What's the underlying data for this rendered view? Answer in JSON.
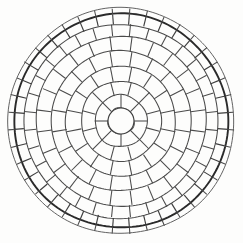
{
  "figure": {
    "type": "concentric-radial-segment-diagram",
    "background_color": "#fdfdfc",
    "line_color": "#4a4a4a",
    "accent_line_color": "#2a2a2a",
    "center": {
      "x": 121,
      "y": 121
    },
    "canvas": {
      "width": 243,
      "height": 243
    }
  },
  "chart_data": {
    "type": "pie",
    "xlabel": "",
    "ylabel": "",
    "categories": [
      "hub",
      "ring-1",
      "ring-2",
      "ring-3",
      "ring-4",
      "ring-5",
      "ring-6",
      "ring-7",
      "rim-band"
    ],
    "values": [
      1,
      8,
      12,
      16,
      20,
      24,
      32,
      40,
      40
    ],
    "series": [
      {
        "name": "segment_count",
        "values": [
          1,
          8,
          12,
          16,
          20,
          24,
          32,
          40,
          40
        ]
      },
      {
        "name": "inner_radius",
        "values": [
          0,
          13,
          26,
          40,
          55,
          70,
          85,
          97,
          107
        ]
      },
      {
        "name": "outer_radius",
        "values": [
          13,
          26,
          40,
          55,
          70,
          85,
          97,
          107,
          113
        ]
      },
      {
        "name": "start_angle_deg",
        "values": [
          0,
          0,
          15,
          11.25,
          9,
          7.5,
          5.625,
          4.5,
          4.5
        ]
      }
    ],
    "grid": false,
    "legend": "none"
  },
  "rings": [
    {
      "name": "hub",
      "r_in": 0,
      "r_out": 13,
      "segments": 1,
      "offset": 0,
      "thick": false
    },
    {
      "name": "ring-1",
      "r_in": 13,
      "r_out": 26,
      "segments": 8,
      "offset": 0,
      "thick": false
    },
    {
      "name": "ring-2",
      "r_in": 26,
      "r_out": 40,
      "segments": 12,
      "offset": 15,
      "thick": false
    },
    {
      "name": "ring-3",
      "r_in": 40,
      "r_out": 55,
      "segments": 16,
      "offset": 11.25,
      "thick": false
    },
    {
      "name": "ring-4",
      "r_in": 55,
      "r_out": 70,
      "segments": 20,
      "offset": 9,
      "thick": false
    },
    {
      "name": "ring-5",
      "r_in": 70,
      "r_out": 85,
      "segments": 24,
      "offset": 7.5,
      "thick": false
    },
    {
      "name": "ring-6",
      "r_in": 85,
      "r_out": 97,
      "segments": 32,
      "offset": 5.625,
      "thick": false
    },
    {
      "name": "ring-7",
      "r_in": 97,
      "r_out": 107,
      "segments": 40,
      "offset": 4.5,
      "thick": true
    },
    {
      "name": "rim-band",
      "r_in": 107,
      "r_out": 113,
      "segments": 40,
      "offset": 4.5,
      "thick": false
    }
  ]
}
